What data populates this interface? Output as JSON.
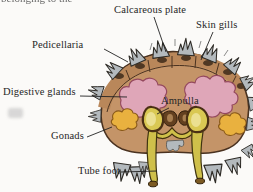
{
  "page": {
    "cropped_top_text": "belonging to the"
  },
  "diagram": {
    "labels": {
      "calcareous_plate": "Calcareous plate",
      "skin_gills": "Skin gills",
      "pedicellaria": "Pedicellaria",
      "digestive_glands": "Digestive glands",
      "ampulla": "Ampulla",
      "gonads": "Gonads",
      "tube_foot": "Tube foot"
    },
    "colors": {
      "page_bg": "#fbfaf8",
      "body": "#c49468",
      "plate_band": "#b9875a",
      "outline": "#4a3220",
      "socket": "#503823",
      "digestive_gland": "#dfa6b8",
      "gland_outline": "#94485e",
      "gonad": "#e9b13f",
      "gonad_outline": "#8a5a1a",
      "ampulla_fill": "#d9c853",
      "ampulla_highlight": "#ebe091",
      "ampulla_outline": "#4a3014",
      "tube_foot_fill": "#cfc04a",
      "tube_foot_outline": "#3f3410",
      "canal_dark": "#42300e",
      "bean_fill": "#63401f",
      "bean_inner": "#b98e5e",
      "spine_gray": "#b3b9bd",
      "spine_outline": "#2e2b26",
      "leader_line": "#222222",
      "label_text": "#262626"
    }
  }
}
